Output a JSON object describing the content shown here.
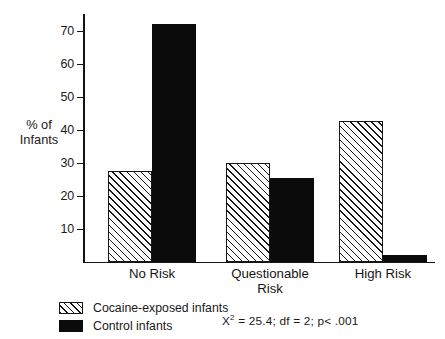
{
  "chart_data": {
    "type": "bar",
    "title": "",
    "xlabel": "",
    "ylabel": "% of\nInfants",
    "ylabel_line1": "% of",
    "ylabel_line2": "Infants",
    "categories": [
      "No Risk",
      "Questionable\nRisk",
      "High Risk"
    ],
    "category_labels": [
      {
        "text": "No Risk"
      },
      {
        "text": "Questionable\nRisk"
      },
      {
        "text": "High Risk"
      }
    ],
    "series": [
      {
        "name": "Cocaine-exposed infants",
        "style": "hatched",
        "values": [
          27.5,
          30.0,
          42.5
        ]
      },
      {
        "name": "Control infants",
        "style": "solid",
        "values": [
          72.0,
          25.5,
          2.0
        ]
      }
    ],
    "ylim": [
      0,
      75
    ],
    "yticks": [
      10,
      20,
      30,
      40,
      50,
      60,
      70
    ],
    "ytick_labels": [
      "10",
      "20",
      "30",
      "40",
      "50",
      "60",
      "70"
    ],
    "grid": false,
    "legend_position": "bottom-left",
    "annotations": [
      {
        "name": "chi-square-statistics",
        "prefix": "X",
        "superscript": "2",
        "rest": " = 25.4; df = 2; p< .001",
        "full_text": "X2 = 25.4; df = 2; p< .001"
      }
    ],
    "colors": {
      "axis": "#141414",
      "solid_bar": "#0b0b0b",
      "hatched_bar_line": "#171717",
      "hatched_bar_fill": "#fdfdfd",
      "background": "#ffffff",
      "text": "#1a1a1a"
    }
  },
  "legend": {
    "items": [
      {
        "label": "Cocaine-exposed infants",
        "style": "hatched"
      },
      {
        "label": "Control infants",
        "style": "solid"
      }
    ]
  }
}
